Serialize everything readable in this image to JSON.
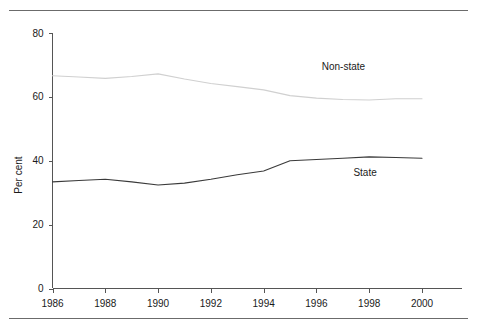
{
  "page": {
    "clipped_header_text": ""
  },
  "chart_data": {
    "type": "line",
    "title": "",
    "xlabel": "",
    "ylabel": "Per cent",
    "xlim": [
      1986,
      2000
    ],
    "ylim": [
      0,
      80
    ],
    "yticks": [
      0,
      20,
      40,
      60,
      80
    ],
    "ytick_labels": [
      "0",
      "20",
      "40",
      "60",
      "80"
    ],
    "xticks": [
      1986,
      1988,
      1990,
      1992,
      1994,
      1996,
      1998,
      2000
    ],
    "xtick_labels": [
      "1986",
      "1988",
      "1990",
      "1992",
      "1994",
      "1996",
      "1998",
      "2000"
    ],
    "grid": false,
    "legend_position": "inline-annotation",
    "x": [
      1986,
      1987,
      1988,
      1989,
      1990,
      1991,
      1992,
      1993,
      1994,
      1995,
      1996,
      1997,
      1998,
      1999,
      2000
    ],
    "series": [
      {
        "name": "Non-state",
        "color": "#d0d0d0",
        "label_x": 1996.2,
        "label_y": 68.5,
        "values": [
          66.6,
          66.2,
          65.8,
          66.4,
          67.2,
          65.6,
          64.2,
          63.2,
          62.2,
          60.4,
          59.6,
          59.2,
          59.0,
          59.4,
          59.4
        ]
      },
      {
        "name": "State",
        "color": "#3a3a3a",
        "label_x": 1997.4,
        "label_y": 35.2,
        "values": [
          33.4,
          33.8,
          34.2,
          33.4,
          32.4,
          33.0,
          34.2,
          35.6,
          36.8,
          40.0,
          40.4,
          40.8,
          41.2,
          41.0,
          40.8
        ]
      }
    ],
    "annotations": [
      {
        "text": "Non-state",
        "x": 1996.2,
        "y": 68.5
      },
      {
        "text": "State",
        "x": 1997.4,
        "y": 35.2
      }
    ]
  }
}
